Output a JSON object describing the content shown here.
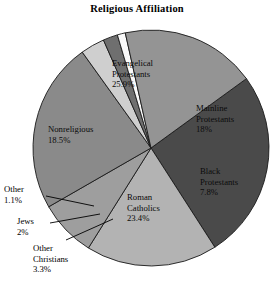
{
  "chart_data": {
    "type": "pie",
    "title": "Religious Affiliation",
    "xlabel": "",
    "ylabel": "",
    "legend_position": "none",
    "grid": false,
    "start_angle_deg": -36,
    "direction": "clockwise",
    "categories": [
      "Evangelical Protestants",
      "Mainline Protestants",
      "Black Protestants",
      "Roman Catholics",
      "Other Christians",
      "Jews",
      "Other",
      "Nonreligious"
    ],
    "values": [
      25.9,
      18.0,
      7.8,
      23.4,
      3.3,
      2.0,
      1.1,
      18.5
    ],
    "value_suffix": "%",
    "slices": [
      {
        "name": "Evangelical Protestants",
        "label_line1": "Evangelical",
        "label_line2": "Protestants",
        "value_text": "25.9%",
        "value": 25.9,
        "color": "#4a4a4a",
        "label_placement": "inside"
      },
      {
        "name": "Mainline Protestants",
        "label_line1": "Mainline",
        "label_line2": "Protestants",
        "value_text": "18%",
        "value": 18.0,
        "color": "#b3b3b3",
        "label_placement": "inside"
      },
      {
        "name": "Black Protestants",
        "label_line1": "Black",
        "label_line2": "Protestants",
        "value_text": "7.8%",
        "value": 7.8,
        "color": "#9e9e9e",
        "label_placement": "inside"
      },
      {
        "name": "Roman Catholics",
        "label_line1": "Roman",
        "label_line2": "Catholics",
        "value_text": "23.4%",
        "value": 23.4,
        "color": "#8a8a8a",
        "label_placement": "inside"
      },
      {
        "name": "Other Christians",
        "label_line1": "Other",
        "label_line2": "Christians",
        "value_text": "3.3%",
        "value": 3.3,
        "color": "#cfcfcf",
        "label_placement": "outside"
      },
      {
        "name": "Jews",
        "label_line1": "Jews",
        "label_line2": "",
        "value_text": "2%",
        "value": 2.0,
        "color": "#6f6f6f",
        "label_placement": "outside"
      },
      {
        "name": "Other",
        "label_line1": "Other",
        "label_line2": "",
        "value_text": "1.1%",
        "value": 1.1,
        "color": "#fafafa",
        "label_placement": "outside"
      },
      {
        "name": "Nonreligious",
        "label_line1": "Nonreligious",
        "label_line2": "",
        "value_text": "18.5%",
        "value": 18.5,
        "color": "#949494",
        "label_placement": "inside"
      }
    ]
  },
  "colors": {
    "background": "#ffffff",
    "outline": "#1a1a1a",
    "text": "#000000"
  }
}
